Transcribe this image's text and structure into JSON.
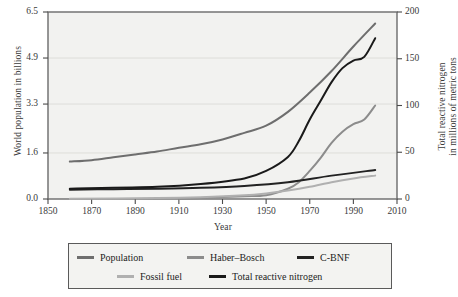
{
  "chart_data": {
    "type": "line",
    "title": "",
    "xlabel": "Year",
    "ylabel": "World population in billions",
    "ylabel_right_line1": "Total reactive nitrogen",
    "ylabel_right_line2": "in millions of metric tons",
    "xlim": [
      1850,
      2010
    ],
    "ylim": [
      0.0,
      6.5
    ],
    "ylim_right": [
      0,
      200
    ],
    "xticks": [
      1850,
      1870,
      1890,
      1910,
      1930,
      1950,
      1970,
      1990,
      2010
    ],
    "yticks_left": [
      "0.0",
      "1.6",
      "3.3",
      "4.9",
      "6.5"
    ],
    "yticks_left_values": [
      0.0,
      1.6,
      3.3,
      4.9,
      6.5
    ],
    "yticks_right": [
      "0",
      "50",
      "100",
      "150",
      "200"
    ],
    "yticks_right_values": [
      0,
      50,
      100,
      150,
      200
    ],
    "grid": true,
    "grid_axis": "y",
    "legend_position": "below-plot",
    "plot_bgcolor": "#f2f2f0",
    "frame_color": "#6b6b6b",
    "gridline_color": "#d8d8d4",
    "series": [
      {
        "name": "Population",
        "axis": "left",
        "unit": "billions",
        "color": "#6e6e6e",
        "x": [
          1860,
          1870,
          1880,
          1890,
          1900,
          1910,
          1920,
          1930,
          1940,
          1950,
          1960,
          1970,
          1980,
          1990,
          2000
        ],
        "values": [
          1.3,
          1.35,
          1.45,
          1.55,
          1.65,
          1.78,
          1.9,
          2.07,
          2.3,
          2.55,
          3.03,
          3.7,
          4.45,
          5.3,
          6.1
        ]
      },
      {
        "name": "Haber–Bosch",
        "axis": "right",
        "unit": "Mt N",
        "color": "#8c8c8c",
        "x": [
          1910,
          1920,
          1930,
          1940,
          1950,
          1960,
          1965,
          1970,
          1975,
          1980,
          1985,
          1990,
          1995,
          2000
        ],
        "values": [
          0,
          1,
          2,
          3,
          4,
          11,
          18,
          30,
          44,
          60,
          72,
          80,
          85,
          100
        ]
      },
      {
        "name": "C-BNF",
        "axis": "right",
        "unit": "Mt N",
        "color": "#222222",
        "x": [
          1860,
          1880,
          1900,
          1920,
          1940,
          1960,
          1980,
          2000
        ],
        "values": [
          10,
          10.5,
          11,
          12,
          14,
          18,
          25,
          31
        ]
      },
      {
        "name": "Fossil fuel",
        "axis": "right",
        "unit": "Mt N",
        "color": "#b0b0b0",
        "x": [
          1860,
          1900,
          1920,
          1940,
          1950,
          1960,
          1970,
          1980,
          1990,
          2000
        ],
        "values": [
          0.3,
          1,
          2,
          4,
          6,
          9,
          13,
          18,
          22,
          25
        ]
      },
      {
        "name": "Total reactive nitrogen",
        "axis": "right",
        "unit": "Mt N",
        "color": "#1a1a1a",
        "x": [
          1860,
          1900,
          1920,
          1940,
          1950,
          1960,
          1965,
          1970,
          1975,
          1980,
          1985,
          1990,
          1995,
          2000
        ],
        "values": [
          11,
          13,
          16,
          22,
          30,
          45,
          62,
          85,
          105,
          125,
          140,
          148,
          152,
          172
        ]
      }
    ]
  },
  "legend": {
    "items": [
      {
        "label": "Population",
        "color": "#6e6e6e"
      },
      {
        "label": "Haber–Bosch",
        "color": "#8c8c8c"
      },
      {
        "label": "C-BNF",
        "color": "#222222"
      },
      {
        "label": "Fossil fuel",
        "color": "#b0b0b0"
      },
      {
        "label": "Total reactive nitrogen",
        "color": "#1a1a1a"
      }
    ]
  }
}
